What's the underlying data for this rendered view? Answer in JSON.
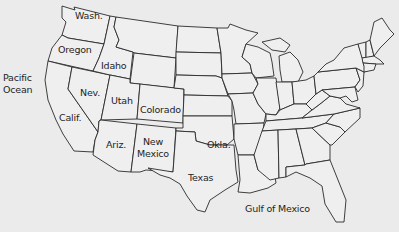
{
  "map": {
    "title": "Continental United States",
    "background_color": "#ebebeb",
    "border_color": "#2a2a2a",
    "labels": {
      "washington": "Wash.",
      "oregon": "Oregon",
      "idaho": "Idaho",
      "nevada": "Nev.",
      "utah": "Utah",
      "colorado": "Colorado",
      "california": "Calif.",
      "arizona": "Ariz.",
      "new_mexico_1": "New",
      "new_mexico_2": "Mexico",
      "oklahoma": "Okla.",
      "texas": "Texas",
      "pacific_1": "Pacific",
      "pacific_2": "Ocean",
      "gulf": "Gulf of Mexico"
    }
  }
}
